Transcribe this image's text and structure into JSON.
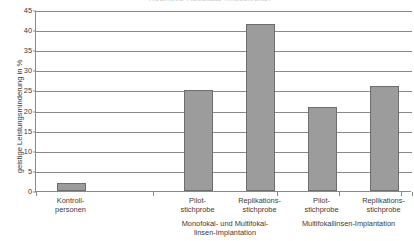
{
  "chart_data": {
    "type": "bar",
    "title": "Kognitive Resultate (Messwerte)",
    "xlabel": "",
    "ylabel": "geistige Leistungsminderung in %",
    "ylim": [
      0,
      45
    ],
    "ytick_step": 5,
    "grid": true,
    "legend": "none",
    "categories": [
      "Kontroll-\npersonen",
      "Pilot-\nstichprobe",
      "Replikations-\nstichprobe",
      "Pilot-\nstichprobe",
      "Replikations-\nstichprobe"
    ],
    "values": [
      2,
      25,
      41.5,
      21,
      26
    ],
    "ytick_labels": [
      "0",
      "5",
      "10",
      "15",
      "20",
      "25",
      "30",
      "35",
      "40",
      "45"
    ],
    "groups": [
      {
        "label": "Monofokal- und Multifokal-\nlinsen-Implantation",
        "categories": [
          1,
          2
        ]
      },
      {
        "label": "Multifokallinsen-Implantation",
        "categories": [
          3,
          4
        ]
      }
    ],
    "colors": {
      "bar_fill": "#9c9c9c",
      "bar_stroke": "#6d6d6d",
      "axis": "#8a8a8a",
      "grid": "#8a8a8a",
      "text": "#3a3a3a"
    }
  }
}
